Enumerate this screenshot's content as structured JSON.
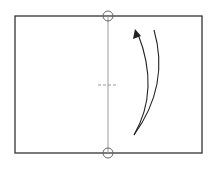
{
  "diagram": {
    "type": "origami-fold-step",
    "colors": {
      "paper_edge": "#333333",
      "fold_line": "#999999",
      "marker": "#666666",
      "arrow": "#222222",
      "background": "#ffffff"
    },
    "paper": {
      "x": 15,
      "y": 16,
      "width": 187,
      "height": 137
    },
    "fold_line": {
      "x": 108,
      "y1": 16,
      "y2": 153
    },
    "reference_circles": [
      {
        "name": "top",
        "cx": 108,
        "cy": 16,
        "r": 5
      },
      {
        "name": "bottom",
        "cx": 108,
        "cy": 153,
        "r": 5
      }
    ],
    "center_mark": {
      "y": 85,
      "x1": 98,
      "x2": 118
    },
    "arrow": {
      "direction": "up",
      "description": "curved fold arrow"
    }
  }
}
